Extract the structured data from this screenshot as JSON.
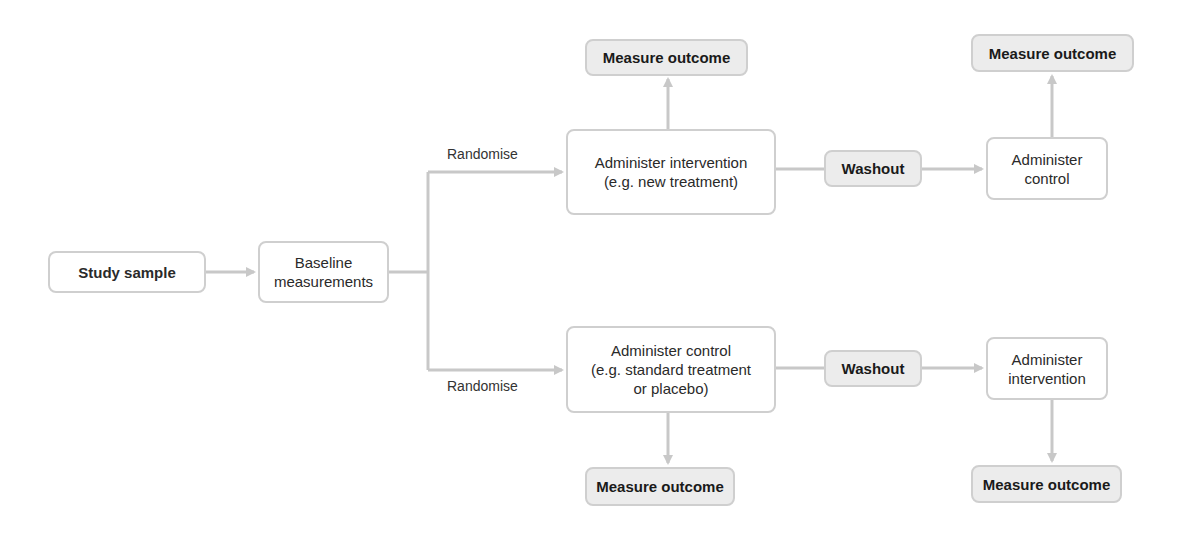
{
  "diagram": {
    "type": "flowchart",
    "colors": {
      "connector": "#c8c8c8",
      "box_border": "#cfcfcf",
      "box_fill": "#ffffff",
      "shaded_fill": "#ececec",
      "text": "#222222"
    },
    "nodes": {
      "study_sample": "Study sample",
      "baseline": "Baseline\nmeasurements",
      "top_intervention": "Administer intervention\n(e.g. new treatment)",
      "top_outcome_1": "Measure outcome",
      "top_washout": "Washout",
      "top_control": "Administer\ncontrol",
      "top_outcome_2": "Measure outcome",
      "bottom_control": "Administer control\n(e.g. standard treatment\nor placebo)",
      "bottom_outcome_1": "Measure outcome",
      "bottom_washout": "Washout",
      "bottom_intervention": "Administer\nintervention",
      "bottom_outcome_2": "Measure outcome"
    },
    "labels": {
      "randomise_top": "Randomise",
      "randomise_bottom": "Randomise"
    },
    "edges": [
      {
        "from": "study_sample",
        "to": "baseline"
      },
      {
        "from": "baseline",
        "to": "top_intervention",
        "label": "Randomise"
      },
      {
        "from": "baseline",
        "to": "bottom_control",
        "label": "Randomise"
      },
      {
        "from": "top_intervention",
        "to": "top_outcome_1"
      },
      {
        "from": "top_intervention",
        "to": "top_washout"
      },
      {
        "from": "top_washout",
        "to": "top_control"
      },
      {
        "from": "top_control",
        "to": "top_outcome_2"
      },
      {
        "from": "bottom_control",
        "to": "bottom_outcome_1"
      },
      {
        "from": "bottom_control",
        "to": "bottom_washout"
      },
      {
        "from": "bottom_washout",
        "to": "bottom_intervention"
      },
      {
        "from": "bottom_intervention",
        "to": "bottom_outcome_2"
      }
    ]
  }
}
